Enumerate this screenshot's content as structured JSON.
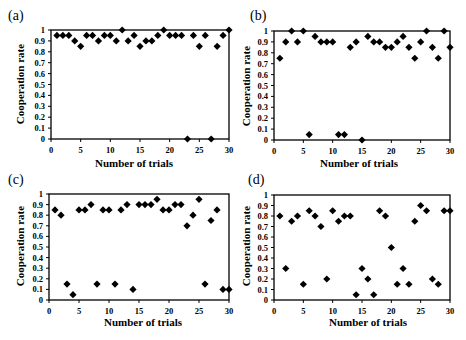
{
  "figure": {
    "panels": [
      {
        "label": "(a)",
        "ylabel": "Cooperation rate",
        "xlabel": "Number of trials"
      },
      {
        "label": "(b)",
        "ylabel": "Cooperation rate",
        "xlabel": "Number of trials"
      },
      {
        "label": "(c)",
        "ylabel": "Cooperation rate",
        "xlabel": "Number of trials"
      },
      {
        "label": "(d)",
        "ylabel": "Cooperation rate",
        "xlabel": "Number of trials"
      }
    ],
    "marker_color": "#000000"
  },
  "chart_data": [
    {
      "type": "scatter",
      "title": "(a)",
      "xlabel": "Number of trials",
      "ylabel": "Cooperation rate",
      "xlim": [
        0,
        30
      ],
      "ylim": [
        0,
        1
      ],
      "xticks": [
        0,
        5,
        10,
        15,
        20,
        25,
        30
      ],
      "yticks": [
        0,
        0.1,
        0.2,
        0.3,
        0.4,
        0.5,
        0.6,
        0.7,
        0.8,
        0.9,
        1
      ],
      "grid": false,
      "marker": "diamond",
      "x": [
        1,
        2,
        3,
        4,
        5,
        6,
        7,
        8,
        9,
        10,
        11,
        12,
        13,
        14,
        15,
        16,
        17,
        18,
        19,
        20,
        21,
        22,
        23,
        24,
        25,
        26,
        27,
        28,
        29,
        30
      ],
      "y": [
        0.95,
        0.95,
        0.95,
        0.9,
        0.85,
        0.95,
        0.95,
        0.9,
        0.95,
        0.95,
        0.9,
        1,
        0.9,
        0.95,
        0.85,
        0.9,
        0.9,
        0.95,
        1,
        0.95,
        0.95,
        0.95,
        0,
        0.95,
        0.85,
        0.95,
        0,
        0.85,
        0.95,
        1
      ]
    },
    {
      "type": "scatter",
      "title": "(b)",
      "xlabel": "Number of trials",
      "ylabel": "Cooperation rate",
      "xlim": [
        0,
        30
      ],
      "ylim": [
        0,
        1
      ],
      "xticks": [
        0,
        5,
        10,
        15,
        20,
        25,
        30
      ],
      "yticks": [
        0,
        0.1,
        0.2,
        0.3,
        0.4,
        0.5,
        0.6,
        0.7,
        0.8,
        0.9,
        1
      ],
      "grid": false,
      "marker": "diamond",
      "x": [
        1,
        2,
        3,
        4,
        5,
        6,
        7,
        8,
        9,
        10,
        11,
        12,
        13,
        14,
        15,
        16,
        17,
        18,
        19,
        20,
        21,
        22,
        23,
        24,
        25,
        26,
        27,
        28,
        29,
        30
      ],
      "y": [
        0.75,
        0.9,
        1,
        0.9,
        1,
        0.05,
        0.95,
        0.9,
        0.9,
        0.9,
        0.05,
        0.05,
        0.85,
        0.9,
        0,
        0.95,
        0.9,
        0.9,
        0.85,
        0.85,
        0.9,
        0.95,
        0.85,
        0.75,
        0.9,
        1,
        0.85,
        0.75,
        1,
        0.85
      ]
    },
    {
      "type": "scatter",
      "title": "(c)",
      "xlabel": "Number of trials",
      "ylabel": "Cooperation rate",
      "xlim": [
        0,
        30
      ],
      "ylim": [
        0,
        1
      ],
      "xticks": [
        0,
        5,
        10,
        15,
        20,
        25,
        30
      ],
      "yticks": [
        0,
        0.1,
        0.2,
        0.3,
        0.4,
        0.5,
        0.6,
        0.7,
        0.8,
        0.9,
        1
      ],
      "grid": false,
      "marker": "diamond",
      "x": [
        1,
        2,
        3,
        4,
        5,
        6,
        7,
        8,
        9,
        10,
        11,
        12,
        13,
        14,
        15,
        16,
        17,
        18,
        19,
        20,
        21,
        22,
        23,
        24,
        25,
        26,
        27,
        28,
        29,
        30
      ],
      "y": [
        0.85,
        0.8,
        0.15,
        0.05,
        0.85,
        0.85,
        0.9,
        0.15,
        0.85,
        0.85,
        0.15,
        0.85,
        0.9,
        0.1,
        0.9,
        0.9,
        0.9,
        0.95,
        0.85,
        0.85,
        0.9,
        0.9,
        0.7,
        0.8,
        0.95,
        0.15,
        0.75,
        0.85,
        0.1,
        0.1
      ]
    },
    {
      "type": "scatter",
      "title": "(d)",
      "xlabel": "Number of trials",
      "ylabel": "Cooperation rate",
      "xlim": [
        0,
        30
      ],
      "ylim": [
        0,
        1
      ],
      "xticks": [
        0,
        5,
        10,
        15,
        20,
        25,
        30
      ],
      "yticks": [
        0,
        0.1,
        0.2,
        0.3,
        0.4,
        0.5,
        0.6,
        0.7,
        0.8,
        0.9,
        1
      ],
      "grid": false,
      "marker": "diamond",
      "x": [
        1,
        2,
        3,
        4,
        5,
        6,
        7,
        8,
        9,
        10,
        11,
        12,
        13,
        14,
        15,
        16,
        17,
        18,
        19,
        20,
        21,
        22,
        23,
        24,
        25,
        26,
        27,
        28,
        29,
        30
      ],
      "y": [
        0.8,
        0.3,
        0.75,
        0.8,
        0.15,
        0.85,
        0.8,
        0.7,
        0.2,
        0.85,
        0.75,
        0.8,
        0.8,
        0.05,
        0.3,
        0.2,
        0.05,
        0.85,
        0.8,
        0.5,
        0.15,
        0.3,
        0.15,
        0.75,
        0.9,
        0.85,
        0.2,
        0.15,
        0.85,
        0.85
      ]
    }
  ]
}
